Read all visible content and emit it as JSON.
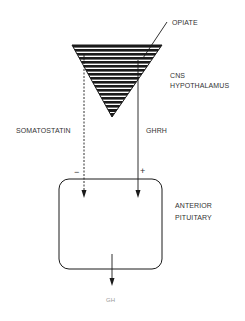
{
  "diagram": {
    "opiate_label": "OPIATE",
    "cns_label_line1": "CNS",
    "cns_label_line2": "HYPOTHALAMUS",
    "somatostatin_label": "SOMATOSTATIN",
    "ghrh_label": "GHRH",
    "minus_sign": "−",
    "plus_sign": "+",
    "pituitary_label_line1": "ANTERIOR",
    "pituitary_label_line2": "PITUITARY",
    "output_label": "GH",
    "colors": {
      "ink": "#1a1a1a",
      "background": "#ffffff"
    }
  }
}
